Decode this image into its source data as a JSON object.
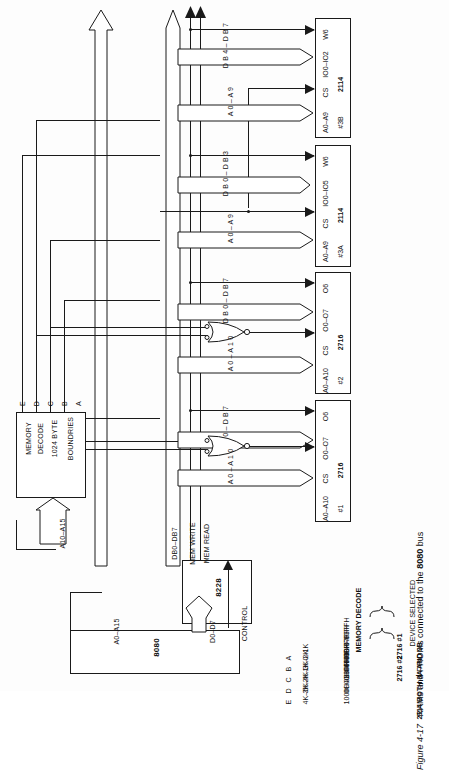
{
  "figure": {
    "number": "Figure 4-17",
    "caption_plain": "RAMs and PROMs connected to the 8080 bus",
    "caption_pre": "RAMs and PROMs connected to the ",
    "caption_bold": "8080",
    "caption_post": " bus"
  },
  "memory_decode_table": {
    "title": "MEMORY DECODE",
    "device_header": "DEVICE SELECTED",
    "rows": [
      {
        "key": "A",
        "range": "0–1K",
        "addr": "000H–03FFH",
        "device": "2716 #1"
      },
      {
        "key": "B",
        "range": "1K–2K",
        "addr": "0400H–07FFH",
        "device": "2716 #1"
      },
      {
        "key": "C",
        "range": "2K–3K",
        "addr": "0800H–0BFFH",
        "device": "2716 #2"
      },
      {
        "key": "D",
        "range": "3K–4K",
        "addr": "0C00H–0FFFH",
        "device": "2716 #2"
      },
      {
        "key": "E",
        "range": "4K–5K",
        "addr": "1000H–13FFH",
        "device": "2114 BOTH 3A AND 3B"
      }
    ],
    "brace_groups": [
      {
        "label": "2716 #1",
        "rows": [
          "A",
          "B"
        ]
      },
      {
        "label": "2716 #2",
        "rows": [
          "C",
          "D"
        ]
      },
      {
        "label": "2114 BOTH 3A AND 3B",
        "rows": [
          "E"
        ]
      }
    ]
  },
  "blocks": {
    "cpu": {
      "label": "8080"
    },
    "bus_ctl": {
      "label": "8228"
    },
    "decoder": {
      "line1": "MEMORY",
      "line2": "DECODE",
      "line3": "1024 BYTE",
      "line4": "BOUNDRIES"
    }
  },
  "decoder_outputs": [
    "E",
    "D",
    "C",
    "B",
    "A"
  ],
  "bus_labels": {
    "cpu_address": "A0–A15",
    "cpu_data": "D0–D7",
    "cpu_control": "CONTROL",
    "decoder_address_in": "A10–A15",
    "system_data": "DB0–DB7",
    "mem_write": "MEM WRITE",
    "mem_read": "MEM READ"
  },
  "chips": [
    {
      "id": "prom1",
      "part": "2716",
      "ref": "#1",
      "addr_pins": "A0–A10",
      "cs_pin": "CS",
      "data_pins": "O0–O7",
      "extra_pin": "O6",
      "addr_bus_label": "A 0 – A 1 0",
      "data_bus_label": "D B 0 – D B 7",
      "gate": "nor"
    },
    {
      "id": "prom2",
      "part": "2716",
      "ref": "#2",
      "addr_pins": "A0–A10",
      "cs_pin": "CS",
      "data_pins": "O0–O7",
      "extra_pin": "O6",
      "addr_bus_label": "A 0 – A 1 0",
      "data_bus_label": "D B 0 – D B 7",
      "gate": "nor"
    },
    {
      "id": "ram3a",
      "part": "2114",
      "ref": "#3A",
      "addr_pins": "A0–A9",
      "cs_pin": "CS",
      "data_pins": "IO0–IO5",
      "extra_pin": "W6",
      "addr_bus_label": "A 0 – A 9",
      "data_bus_label": "D B 0 – D B 3",
      "gate": "none"
    },
    {
      "id": "ram3b",
      "part": "2114",
      "ref": "#3B",
      "addr_pins": "A0–A9",
      "cs_pin": "CS",
      "data_pins": "IO0–IO2",
      "extra_pin": "W6",
      "addr_bus_label": "A 0 – A 9",
      "data_bus_label": "D B 4 – D B 7",
      "gate": "none"
    }
  ]
}
